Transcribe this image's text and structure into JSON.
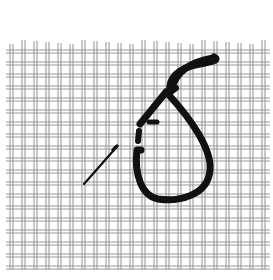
{
  "figure": {
    "subject": "needlepoint canvas mesh with thread loop and needle",
    "background_color": "#ffffff",
    "mesh_color": "#9a9a9a",
    "thread_color": "#111111",
    "grid": {
      "x_start": 10,
      "x_end": 268,
      "y_start": 14,
      "y_end": 270,
      "spacing": 12
    },
    "elements": [
      "canvas-mesh",
      "thread-loop",
      "needle"
    ]
  }
}
